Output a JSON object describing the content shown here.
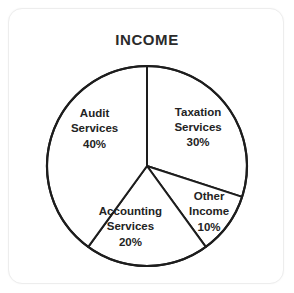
{
  "card": {
    "background_color": "#ffffff",
    "border_color": "#ededed"
  },
  "chart_data": {
    "type": "pie",
    "title": "INCOME",
    "xlabel": "",
    "ylabel": "",
    "legend": "none",
    "grid": false,
    "unit": "%",
    "start_angle_deg": 0,
    "direction": "clockwise",
    "categories": [
      "Taxation Services",
      "Other Income",
      "Accounting Services",
      "Audit Services"
    ],
    "values": [
      30,
      10,
      20,
      40
    ],
    "slices": [
      {
        "label": "Taxation Services",
        "value": 30,
        "value_text": "30%",
        "line1": "Taxation",
        "line2": "Services",
        "line3": "30%",
        "start_angle_deg": 0,
        "end_angle_deg": 108,
        "fill_color": "#ffffff",
        "stroke_color": "#1d1d1d",
        "label_x_pct": 68.5,
        "label_y_pct": 43.0
      },
      {
        "label": "Other Income",
        "value": 10,
        "value_text": "10%",
        "line1": "Other",
        "line2": "Income",
        "line3": "10%",
        "start_angle_deg": 108,
        "end_angle_deg": 144,
        "fill_color": "#ffffff",
        "stroke_color": "#1d1d1d",
        "label_x_pct": 72.5,
        "label_y_pct": 73.5
      },
      {
        "label": "Accounting Services",
        "value": 20,
        "value_text": "20%",
        "line1": "Accounting",
        "line2": "Services",
        "line3": "20%",
        "start_angle_deg": 144,
        "end_angle_deg": 216,
        "fill_color": "#ffffff",
        "stroke_color": "#1d1d1d",
        "label_x_pct": 44.0,
        "label_y_pct": 79.0
      },
      {
        "label": "Audit Services",
        "value": 40,
        "value_text": "40%",
        "line1": "Audit",
        "line2": "Services",
        "line3": "40%",
        "start_angle_deg": 216,
        "end_angle_deg": 360,
        "fill_color": "#ffffff",
        "stroke_color": "#1d1d1d",
        "label_x_pct": 31.0,
        "label_y_pct": 43.5
      }
    ]
  },
  "geometry": {
    "center_x": 138,
    "center_y": 157,
    "radius": 100
  }
}
